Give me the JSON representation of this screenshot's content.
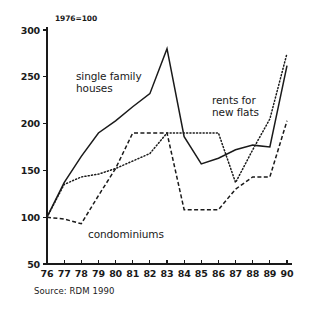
{
  "chart_data": {
    "type": "line",
    "title": "",
    "index_note": "1976=100",
    "source": "Source: RDM 1990",
    "xlabel": "",
    "ylabel": "",
    "xlim": [
      1976,
      1990
    ],
    "ylim": [
      50,
      300
    ],
    "grid": false,
    "legend_position": "inline-annotations",
    "yticks": [
      50,
      100,
      150,
      200,
      250,
      300
    ],
    "ytick_labels": [
      "50",
      "100",
      "150",
      "200",
      "250",
      "300"
    ],
    "x": [
      1976,
      1977,
      1978,
      1979,
      1980,
      1981,
      1982,
      1983,
      1984,
      1985,
      1986,
      1987,
      1988,
      1989,
      1990
    ],
    "xtick_labels": [
      "76",
      "77",
      "78",
      "79",
      "80",
      "81",
      "82",
      "83",
      "84",
      "85",
      "86",
      "87",
      "88",
      "89",
      "90"
    ],
    "series": [
      {
        "name": "single family houses",
        "style": "solid",
        "label_line_1": "single family",
        "label_line_2": "houses",
        "values": [
          100,
          137,
          165,
          190,
          203,
          218,
          232,
          280,
          186,
          157,
          163,
          172,
          177,
          175,
          262
        ]
      },
      {
        "name": "condominiums",
        "style": "dashed",
        "label_line_1": "condominiums",
        "label_line_2": "",
        "values": [
          100,
          98,
          93,
          123,
          152,
          190,
          190,
          190,
          108,
          108,
          108,
          130,
          143,
          143,
          203
        ]
      },
      {
        "name": "rents for new flats",
        "style": "dotted",
        "label_line_1": "rents for",
        "label_line_2": "new flats",
        "values": [
          100,
          135,
          143,
          146,
          152,
          160,
          168,
          190,
          190,
          190,
          190,
          137,
          172,
          205,
          275
        ]
      }
    ]
  },
  "labels": {
    "index_note": "1976=100",
    "source": "Source: RDM 1990"
  }
}
